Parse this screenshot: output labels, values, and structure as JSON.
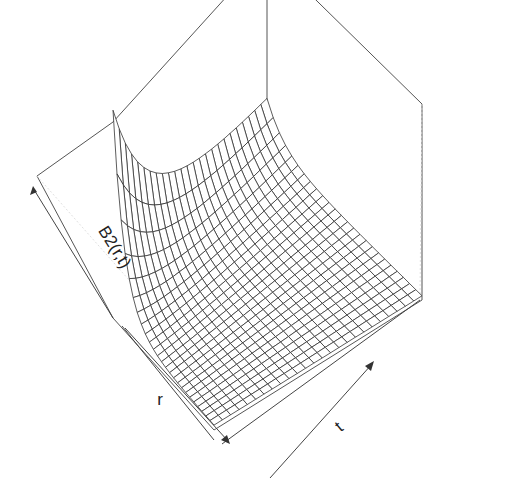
{
  "chart_data": {
    "type": "surface",
    "render": "perspective wireframe (persp)",
    "title": "",
    "xlabel": "r",
    "ylabel": "t",
    "zlabel": "B2(r,t)",
    "grid_resolution": {
      "r_steps": 25,
      "t_steps": 25
    },
    "ticks": "none (axis arrows only)",
    "z_range": [
      0,
      1
    ],
    "colors": {
      "mesh": "#333333",
      "box": "#555555",
      "background": "#ffffff"
    }
  },
  "axes": {
    "z_label": "B2(r,t)",
    "r_label": "r",
    "t_label": "t"
  },
  "projection": {
    "top_back": [
      267,
      29
    ],
    "left": [
      37,
      176
    ],
    "right": [
      497,
      154
    ],
    "front_bottom": [
      214,
      475
    ],
    "vertical_back_bottom": [
      267,
      148
    ],
    "box_front_left_top": [
      122,
      122
    ],
    "height_px": 200
  }
}
